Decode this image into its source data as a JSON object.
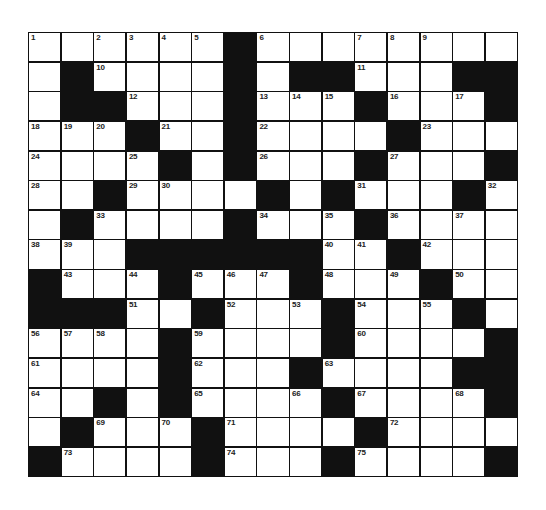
{
  "puzzle": {
    "rows": 15,
    "cols": 15,
    "colors": {
      "block": "#111111",
      "cell": "#ffffff",
      "number": "#222222"
    },
    "grid": [
      [
        "1",
        "",
        "2",
        "3",
        "4",
        "5",
        "#",
        "6",
        "",
        "",
        "7",
        "8",
        "9",
        "",
        ""
      ],
      [
        "",
        "#",
        "10",
        "",
        "",
        "",
        "#",
        "",
        "#",
        "#",
        "11",
        "",
        "",
        "#",
        "#"
      ],
      [
        "",
        "#",
        "#",
        "12",
        "",
        "",
        "#",
        "13",
        "14",
        "15",
        "#",
        "16",
        "",
        "17",
        "#"
      ],
      [
        "18",
        "19",
        "20",
        "#",
        "21",
        "",
        "#",
        "22",
        "",
        "",
        "",
        "#",
        "23",
        "",
        ""
      ],
      [
        "24",
        "",
        "",
        "25",
        "#",
        "",
        "#",
        "26",
        "",
        "",
        "#",
        "27",
        "",
        "",
        "#"
      ],
      [
        "28",
        "",
        "#",
        "29",
        "30",
        "",
        "",
        "#",
        "",
        "#",
        "31",
        "",
        "",
        "#",
        "32"
      ],
      [
        "",
        "#",
        "33",
        "",
        "",
        "",
        "#",
        "34",
        "",
        "35",
        "#",
        "36",
        "",
        "37",
        ""
      ],
      [
        "38",
        "39",
        "",
        "#",
        "#",
        "#",
        "#",
        "#",
        "#",
        "40",
        "41",
        "#",
        "42",
        "",
        ""
      ],
      [
        "#",
        "43",
        "",
        "44",
        "#",
        "45",
        "46",
        "47",
        "#",
        "48",
        "",
        "49",
        "#",
        "50",
        ""
      ],
      [
        "#",
        "#",
        "#",
        "51",
        "",
        "#",
        "52",
        "",
        "53",
        "#",
        "54",
        "",
        "55",
        "#",
        ""
      ],
      [
        "56",
        "57",
        "58",
        "",
        "#",
        "59",
        "",
        "",
        "",
        "#",
        "60",
        "",
        "",
        "",
        "#"
      ],
      [
        "61",
        "",
        "",
        "",
        "#",
        "62",
        "",
        "",
        "#",
        "63",
        "",
        "",
        "",
        "#",
        "#"
      ],
      [
        "64",
        "",
        "#",
        "",
        "#",
        "65",
        "",
        "",
        "66",
        "#",
        "67",
        "",
        "",
        "68",
        "#"
      ],
      [
        "",
        "#",
        "69",
        "",
        "70",
        "#",
        "71",
        "",
        "",
        "",
        "#",
        "72",
        "",
        "",
        ""
      ],
      [
        "#",
        "73",
        "",
        "",
        "",
        "#",
        "74",
        "",
        "",
        "#",
        "75",
        "",
        "",
        "",
        "#"
      ]
    ]
  }
}
